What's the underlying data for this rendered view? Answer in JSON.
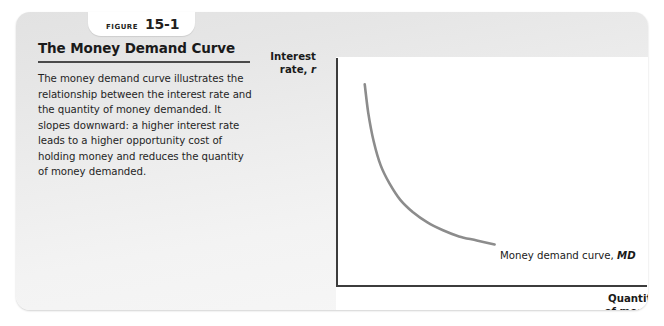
{
  "figure": {
    "tab_word": "FIGURE",
    "tab_number": "15-1",
    "title": "The Money Demand Curve",
    "body": "The money demand curve illustrates the relationship between the interest rate and the quantity of money demanded. It slopes downward: a higher interest rate leads to a higher opportunity cost of holding money and reduces the quantity of money demanded."
  },
  "chart_data": {
    "type": "line",
    "title": "The Money Demand Curve",
    "xlabel_line1": "Quantity",
    "xlabel_line2": "of money",
    "ylabel_line1": "Interest",
    "ylabel_line2_text": "rate,",
    "ylabel_variable": "r",
    "series": [
      {
        "name": "Money demand curve, MD",
        "label_text": "Money demand curve,",
        "label_variable": "MD",
        "color": "#8c8c8c",
        "x": [
          0.12,
          0.16,
          0.22,
          0.3,
          0.4,
          0.52,
          0.66,
          0.82,
          1.0,
          1.18,
          1.38,
          1.58
        ],
        "y": [
          0.94,
          0.8,
          0.66,
          0.54,
          0.45,
          0.37,
          0.31,
          0.26,
          0.22,
          0.19,
          0.17,
          0.15
        ]
      }
    ],
    "xlim": [
      0,
      2.0
    ],
    "ylim": [
      0,
      1.0
    ],
    "grid": false,
    "legend": "none",
    "axis_ticks": "none"
  },
  "colors": {
    "card_background": "#ebebeb",
    "panel_background": "#ffffff",
    "axis": "#3c3c3c",
    "curve": "#8c8c8c",
    "text": "#1a1a1a",
    "rule": "#4a4a4a"
  }
}
